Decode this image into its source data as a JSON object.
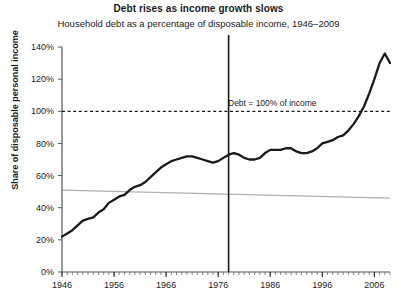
{
  "chart_data": {
    "type": "line",
    "title": "Debt rises as income growth slows",
    "subtitle": "Household debt as a percentage of disposable income, 1946–2009",
    "xlabel": "",
    "ylabel": "Share of disposable personal income",
    "xlim": [
      1946,
      2009
    ],
    "ylim": [
      0,
      140
    ],
    "ytick_labels": [
      "0%",
      "20%",
      "40%",
      "60%",
      "80%",
      "100%",
      "120%",
      "140%"
    ],
    "ytick_values": [
      0,
      20,
      40,
      60,
      80,
      100,
      120,
      140
    ],
    "xtick_labels": [
      "1946",
      "1956",
      "1966",
      "1976",
      "1986",
      "1996",
      "2006"
    ],
    "xtick_values": [
      1946,
      1956,
      1966,
      1976,
      1986,
      1996,
      2006
    ],
    "minor_xtick_interval": 1,
    "grid": false,
    "legend": null,
    "series": [
      {
        "name": "Household debt as share of disposable personal income",
        "color": "#1a1a1a",
        "x": [
          1946,
          1947,
          1948,
          1949,
          1950,
          1951,
          1952,
          1953,
          1954,
          1955,
          1956,
          1957,
          1958,
          1959,
          1960,
          1961,
          1962,
          1963,
          1964,
          1965,
          1966,
          1967,
          1968,
          1969,
          1970,
          1971,
          1972,
          1973,
          1974,
          1975,
          1976,
          1977,
          1978,
          1979,
          1980,
          1981,
          1982,
          1983,
          1984,
          1985,
          1986,
          1987,
          1988,
          1989,
          1990,
          1991,
          1992,
          1993,
          1994,
          1995,
          1996,
          1997,
          1998,
          1999,
          2000,
          2001,
          2002,
          2003,
          2004,
          2005,
          2006,
          2007,
          2008,
          2009
        ],
        "values": [
          22,
          24,
          26,
          29,
          32,
          33,
          34,
          37,
          39,
          43,
          45,
          47,
          48,
          51,
          53,
          54,
          56,
          59,
          62,
          65,
          67,
          69,
          70,
          71,
          72,
          72,
          71,
          70,
          69,
          68,
          69,
          71,
          73,
          74,
          73,
          71,
          70,
          70,
          71,
          74,
          76,
          76,
          76,
          77,
          77,
          75,
          74,
          74,
          75,
          77,
          80,
          81,
          82,
          84,
          85,
          88,
          92,
          97,
          103,
          111,
          120,
          130,
          136,
          130
        ]
      }
    ],
    "reference_lines": [
      {
        "name": "debt-equals-income",
        "orientation": "horizontal",
        "value": 100,
        "style": "dashed",
        "color": "#1a1a1a",
        "label": "Debt = 100% of income"
      },
      {
        "name": "era-divider",
        "orientation": "vertical",
        "value": 1978,
        "style": "solid",
        "color": "#1a1a1a",
        "label": ""
      },
      {
        "name": "income-growth-trend",
        "orientation": "diagonal",
        "from": [
          1946,
          51
        ],
        "to": [
          2009,
          46
        ],
        "style": "solid",
        "color": "#b0b0b0",
        "label": ""
      }
    ]
  }
}
